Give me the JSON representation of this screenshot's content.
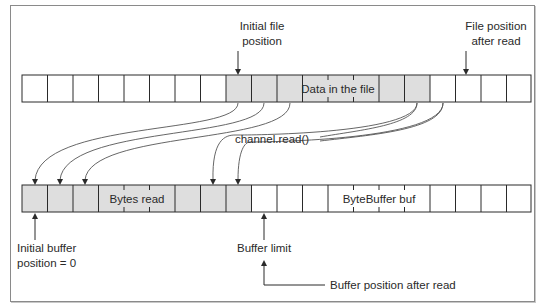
{
  "diagram": {
    "labels": {
      "initial_file_position": [
        "Initial file",
        "position"
      ],
      "file_position_after_read": [
        "File position",
        "after read"
      ],
      "data_in_file": "Data in the file",
      "channel_read": "channel.read()",
      "bytes_read": "Bytes read",
      "byte_buffer": "ByteBuffer buf",
      "initial_buffer_position": [
        "Initial buffer",
        "position = 0"
      ],
      "buffer_limit": "Buffer limit",
      "buffer_position_after_read": "Buffer position after read"
    },
    "file_row": {
      "cell_count": 20,
      "data_cells_start": 8,
      "data_cells_end": 16
    },
    "buffer_row": {
      "cell_count": 20,
      "read_cells_start": 0,
      "read_cells_end": 9
    },
    "colors": {
      "filled": "#dedede",
      "empty": "#ffffff",
      "stroke": "#2a2a2a",
      "arrow": "#555555"
    }
  }
}
